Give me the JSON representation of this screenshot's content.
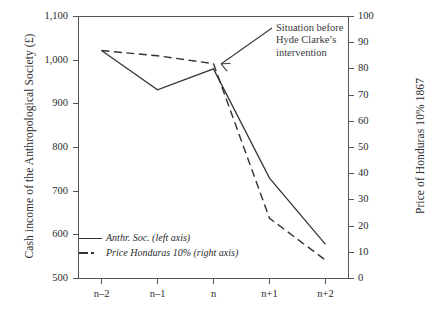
{
  "chart_data": {
    "type": "line",
    "title": "",
    "categories": [
      "n-2",
      "n-1",
      "n",
      "n+1",
      "n+2"
    ],
    "x_tick_labels": [
      "n–2",
      "n–1",
      "n",
      "n+1",
      "n+2"
    ],
    "xlabel": "",
    "grid": false,
    "legend_position": "inside-lower-left",
    "axes": {
      "left": {
        "label": "Cash income of the Anthropological Society (£)",
        "min": 500,
        "max": 1100,
        "step": 100,
        "ticks": [
          "500",
          "600",
          "700",
          "800",
          "900",
          "1,000",
          "1,100"
        ],
        "tick_values": [
          500,
          600,
          700,
          800,
          900,
          1000,
          1100
        ]
      },
      "right": {
        "label": "Price of Honduras 10% 1867",
        "min": 0,
        "max": 100,
        "step": 10,
        "ticks": [
          "0",
          "10",
          "20",
          "30",
          "40",
          "50",
          "60",
          "70",
          "80",
          "90",
          "100"
        ],
        "tick_values": [
          0,
          10,
          20,
          30,
          40,
          50,
          60,
          70,
          80,
          90,
          100
        ]
      }
    },
    "series": [
      {
        "name": "Anthr. Soc. (left axis)",
        "legend_label": "Anthr. Soc. (left axis)",
        "axis": "left",
        "style": "solid",
        "color": "#333333",
        "values": [
          1022,
          932,
          980,
          730,
          578
        ]
      },
      {
        "name": "Price Honduras 10% (right axis)",
        "legend_label": "Price Honduras 10% (right axis)",
        "axis": "right",
        "style": "dashed",
        "color": "#333333",
        "values": [
          87,
          85,
          82,
          23,
          7
        ]
      }
    ],
    "annotations": [
      {
        "name": "situation-before-note",
        "lines": [
          "Situation before",
          "Hyde Clarke’s",
          "intervention"
        ],
        "text": "Situation before Hyde Clarke’s intervention",
        "points_to": {
          "x_category": "n",
          "axis": "right",
          "value": 82
        }
      }
    ]
  },
  "legend": {
    "items": [
      {
        "label": "Anthr. Soc. (left axis)",
        "style": "solid"
      },
      {
        "label": "Price Honduras 10% (right axis)",
        "style": "dashed"
      }
    ]
  }
}
